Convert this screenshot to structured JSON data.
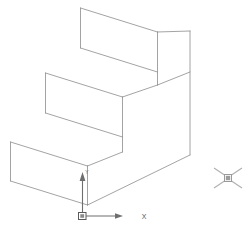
{
  "document": {
    "type": "cad-isometric-wireframe",
    "description": "Isometric wireframe view of a three-step staircase solid",
    "background_color": "#ffffff",
    "line_color": "#8c8c8c",
    "width": 251,
    "height": 236
  },
  "ucs_icon": {
    "name": "ucs-coordinate-icon",
    "origin": {
      "x": 82,
      "y": 216
    },
    "x_axis_label": "X",
    "y_axis_label": "Y",
    "axis_color": "#6e6e6e",
    "x_axis_end": {
      "x": 122,
      "y": 216
    },
    "y_axis_end": {
      "x": 82,
      "y": 173
    }
  },
  "cursor": {
    "name": "crosshair-pickbox-cursor",
    "center": {
      "x": 228,
      "y": 178
    },
    "arm_length": 14,
    "pickbox_size": 6,
    "color": "#b0b0b0"
  },
  "geometry": {
    "name": "stepped-solid",
    "step_count": 3,
    "edges": [
      {
        "id": "top-step-front-left-vertical",
        "path": "M 80.5 8 L 80.5 48"
      },
      {
        "id": "top-step-top-rear-edge",
        "path": "M 80.5 8 L 157.5 32"
      },
      {
        "id": "top-step-bottom-front-edge",
        "path": "M 80.5 48 L 157.5 72"
      },
      {
        "id": "top-step-tread-right-to-back",
        "path": "M 157.5 32 L 190 31"
      },
      {
        "id": "top-step-riser-right-vertical",
        "path": "M 157.5 32 L 157.5 72"
      },
      {
        "id": "top-step-tread-front-right-diag",
        "path": "M 157.5 72 L 190 62"
      },
      {
        "id": "mid-step-front-left-vertical",
        "path": "M 45.5 73 L 45.5 113"
      },
      {
        "id": "mid-step-top-rear-edge",
        "path": "M 45.5 73 L 122.5 97"
      },
      {
        "id": "mid-step-bottom-front-edge",
        "path": "M 45.5 113 L 122.5 137"
      },
      {
        "id": "mid-step-riser-right-vertical",
        "path": "M 122.5 97 L 122.5 137"
      },
      {
        "id": "mid-step-tread-upper-join",
        "path": "M 122.5 97 L 157.5 85"
      },
      {
        "id": "bot-step-front-left-vertical",
        "path": "M 10.5 142 L 10.5 181"
      },
      {
        "id": "bot-step-top-rear-edge",
        "path": "M 10.5 142 L 87.5 166"
      },
      {
        "id": "bot-step-bottom-front-edge",
        "path": "M 10.5 181 L 87.5 205"
      },
      {
        "id": "bot-step-riser-right-vertical",
        "path": "M 87.5 166 L 87.5 205"
      },
      {
        "id": "bot-step-tread-mid-join",
        "path": "M 87.5 166 L 122.5 152"
      },
      {
        "id": "back-right-tall-vertical",
        "path": "M 190 31 L 190 155"
      },
      {
        "id": "bottom-front-right-diag",
        "path": "M 87.5 205 L 190 155"
      },
      {
        "id": "mid-riser-lower-join",
        "path": "M 122.5 137 L 122.5 152"
      },
      {
        "id": "top-riser-lower-join",
        "path": "M 157.5 72 L 157.5 85"
      },
      {
        "id": "right-face-upper-diag",
        "path": "M 190 62 L 190 31"
      }
    ]
  }
}
